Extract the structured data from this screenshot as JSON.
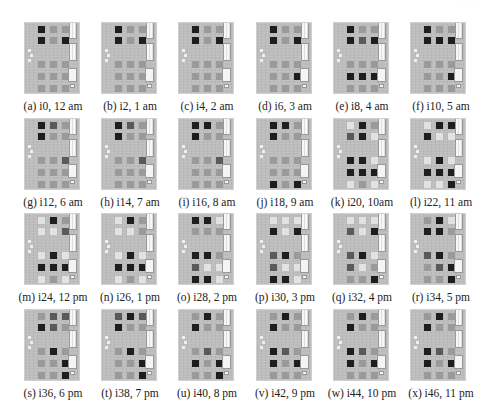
{
  "header_fragment": "· ·        ·",
  "figure": {
    "columns": 6,
    "rows": 4,
    "panels": [
      {
        "tag": "(a)",
        "iter": "i0",
        "time": "12 am",
        "caption": "(a) i0, 12 am",
        "dark": [
          [
            0,
            0
          ],
          [
            1,
            0
          ],
          [
            1,
            2
          ]
        ],
        "light": [],
        "mid": []
      },
      {
        "tag": "(b)",
        "iter": "i2",
        "time": "1 am",
        "caption": "(b) i2, 1 am",
        "dark": [
          [
            0,
            0
          ],
          [
            1,
            0
          ],
          [
            1,
            2
          ]
        ],
        "light": [],
        "mid": []
      },
      {
        "tag": "(c)",
        "iter": "i4",
        "time": "2 am",
        "caption": "(c) i4, 2 am",
        "dark": [
          [
            0,
            0
          ],
          [
            1,
            0
          ],
          [
            1,
            2
          ]
        ],
        "light": [],
        "mid": []
      },
      {
        "tag": "(d)",
        "iter": "i6",
        "time": "3 am",
        "caption": "(d) i6, 3 am",
        "dark": [
          [
            0,
            0
          ],
          [
            1,
            0
          ],
          [
            1,
            2
          ],
          [
            3,
            2
          ]
        ],
        "light": [],
        "mid": []
      },
      {
        "tag": "(e)",
        "iter": "i8",
        "time": "4 am",
        "caption": "(e) i8, 4 am",
        "dark": [
          [
            0,
            0
          ],
          [
            1,
            0
          ],
          [
            1,
            2
          ],
          [
            3,
            0
          ],
          [
            3,
            1
          ],
          [
            3,
            2
          ]
        ],
        "light": [],
        "mid": [
          [
            1,
            1
          ]
        ]
      },
      {
        "tag": "(f)",
        "iter": "i10",
        "time": "5 am",
        "caption": "(f) i10, 5 am",
        "dark": [
          [
            0,
            0
          ],
          [
            1,
            0
          ],
          [
            1,
            1
          ],
          [
            1,
            2
          ],
          [
            3,
            2
          ]
        ],
        "light": [],
        "mid": []
      },
      {
        "tag": "(g)",
        "iter": "i12",
        "time": "6 am",
        "caption": "(g) i12, 6 am",
        "dark": [
          [
            0,
            0
          ],
          [
            1,
            0
          ]
        ],
        "light": [],
        "mid": [
          [
            0,
            1
          ],
          [
            2,
            2
          ]
        ]
      },
      {
        "tag": "(h)",
        "iter": "i14",
        "time": "7 am",
        "caption": "(h) i14, 7 am",
        "dark": [
          [
            0,
            0
          ],
          [
            1,
            0
          ]
        ],
        "light": [],
        "mid": [
          [
            0,
            1
          ],
          [
            2,
            2
          ]
        ]
      },
      {
        "tag": "(i)",
        "iter": "i16",
        "time": "8 am",
        "caption": "(i) i16, 8 am",
        "dark": [
          [
            0,
            0
          ],
          [
            0,
            1
          ],
          [
            1,
            0
          ]
        ],
        "light": [],
        "mid": [
          [
            2,
            2
          ]
        ]
      },
      {
        "tag": "(j)",
        "iter": "i18",
        "time": "9 am",
        "caption": "(j) i18, 9 am",
        "dark": [
          [
            0,
            0
          ],
          [
            0,
            1
          ],
          [
            1,
            0
          ],
          [
            4,
            0
          ],
          [
            4,
            2
          ]
        ],
        "light": [],
        "mid": []
      },
      {
        "tag": "(k)",
        "iter": "i20",
        "time": "10am",
        "caption": "(k) i20, 10am",
        "dark": [
          [
            0,
            1
          ],
          [
            1,
            1
          ],
          [
            2,
            0
          ],
          [
            2,
            1
          ],
          [
            3,
            0
          ],
          [
            3,
            1
          ],
          [
            3,
            2
          ]
        ],
        "light": [
          [
            0,
            0
          ],
          [
            1,
            2
          ],
          [
            2,
            2
          ],
          [
            4,
            0
          ],
          [
            4,
            2
          ]
        ],
        "mid": [
          [
            1,
            0
          ]
        ]
      },
      {
        "tag": "(l)",
        "iter": "i22",
        "time": "11 am",
        "caption": "(l) i22, 11 am",
        "dark": [
          [
            0,
            1
          ],
          [
            0,
            2
          ],
          [
            1,
            0
          ],
          [
            2,
            1
          ],
          [
            3,
            0
          ],
          [
            3,
            1
          ],
          [
            3,
            2
          ],
          [
            4,
            2
          ]
        ],
        "light": [
          [
            0,
            0
          ],
          [
            1,
            1
          ],
          [
            1,
            2
          ],
          [
            2,
            0
          ],
          [
            2,
            2
          ],
          [
            4,
            0
          ],
          [
            4,
            1
          ]
        ],
        "mid": []
      },
      {
        "tag": "(m)",
        "iter": "i24",
        "time": "12 pm",
        "caption": "(m) i24, 12 pm",
        "dark": [
          [
            0,
            1
          ],
          [
            2,
            1
          ],
          [
            3,
            0
          ],
          [
            3,
            1
          ],
          [
            3,
            2
          ]
        ],
        "light": [
          [
            0,
            0
          ],
          [
            1,
            0
          ],
          [
            1,
            1
          ],
          [
            2,
            0
          ],
          [
            2,
            2
          ],
          [
            4,
            0
          ],
          [
            4,
            2
          ]
        ],
        "mid": [
          [
            1,
            2
          ]
        ]
      },
      {
        "tag": "(n)",
        "iter": "i26",
        "time": "1 pm",
        "caption": "(n) i26, 1 pm",
        "dark": [
          [
            0,
            1
          ],
          [
            2,
            1
          ],
          [
            3,
            0
          ],
          [
            3,
            1
          ],
          [
            3,
            2
          ]
        ],
        "light": [
          [
            0,
            0
          ],
          [
            1,
            0
          ],
          [
            1,
            1
          ],
          [
            2,
            0
          ],
          [
            2,
            2
          ],
          [
            4,
            0
          ],
          [
            4,
            2
          ]
        ],
        "mid": []
      },
      {
        "tag": "(o)",
        "iter": "i28",
        "time": "2 pm",
        "caption": "(o) i28, 2 pm",
        "dark": [
          [
            0,
            0
          ],
          [
            0,
            1
          ],
          [
            2,
            0
          ],
          [
            2,
            1
          ],
          [
            4,
            0
          ],
          [
            4,
            1
          ]
        ],
        "light": [
          [
            0,
            2
          ],
          [
            3,
            1
          ],
          [
            3,
            2
          ],
          [
            4,
            2
          ]
        ],
        "mid": [
          [
            3,
            0
          ]
        ]
      },
      {
        "tag": "(p)",
        "iter": "i30",
        "time": "3 pm",
        "caption": "(p) i30, 3 pm",
        "dark": [
          [
            1,
            0
          ],
          [
            1,
            2
          ],
          [
            2,
            1
          ],
          [
            4,
            0
          ],
          [
            4,
            1
          ]
        ],
        "light": [
          [
            0,
            0
          ],
          [
            0,
            1
          ],
          [
            0,
            2
          ],
          [
            1,
            1
          ],
          [
            3,
            1
          ],
          [
            3,
            2
          ],
          [
            4,
            2
          ]
        ],
        "mid": [
          [
            2,
            0
          ],
          [
            3,
            0
          ]
        ]
      },
      {
        "tag": "(q)",
        "iter": "i32",
        "time": "4 pm",
        "caption": "(q) i32, 4 pm",
        "dark": [
          [
            1,
            2
          ],
          [
            2,
            1
          ],
          [
            4,
            2
          ]
        ],
        "light": [
          [
            0,
            0
          ],
          [
            0,
            1
          ],
          [
            0,
            2
          ],
          [
            1,
            1
          ],
          [
            2,
            2
          ],
          [
            3,
            1
          ]
        ],
        "mid": [
          [
            1,
            0
          ],
          [
            2,
            0
          ],
          [
            3,
            0
          ]
        ]
      },
      {
        "tag": "(r)",
        "iter": "i34",
        "time": "5 pm",
        "caption": "(r) i34, 5 pm",
        "dark": [
          [
            0,
            1
          ],
          [
            1,
            0
          ],
          [
            1,
            1
          ],
          [
            2,
            1
          ],
          [
            3,
            2
          ],
          [
            4,
            2
          ]
        ],
        "light": [
          [
            0,
            2
          ]
        ],
        "mid": [
          [
            2,
            0
          ],
          [
            3,
            1
          ]
        ]
      },
      {
        "tag": "(s)",
        "iter": "i36",
        "time": "6 pm",
        "caption": "(s) i36, 6 pm",
        "dark": [
          [
            1,
            0
          ],
          [
            2,
            1
          ],
          [
            3,
            2
          ],
          [
            4,
            2
          ]
        ],
        "light": [],
        "mid": [
          [
            0,
            1
          ],
          [
            0,
            2
          ],
          [
            1,
            1
          ]
        ]
      },
      {
        "tag": "(t)",
        "iter": "i38",
        "time": "7 pm",
        "caption": "(t) i38, 7 pm",
        "dark": [
          [
            0,
            1
          ],
          [
            1,
            0
          ],
          [
            2,
            1
          ],
          [
            3,
            2
          ],
          [
            4,
            2
          ]
        ],
        "light": [],
        "mid": [
          [
            0,
            0
          ],
          [
            0,
            2
          ]
        ]
      },
      {
        "tag": "(u)",
        "iter": "i40",
        "time": "8 pm",
        "caption": "(u) i40, 8 pm",
        "dark": [
          [
            0,
            1
          ],
          [
            1,
            0
          ],
          [
            3,
            0
          ],
          [
            3,
            2
          ],
          [
            4,
            2
          ]
        ],
        "light": [],
        "mid": [
          [
            2,
            1
          ]
        ]
      },
      {
        "tag": "(v)",
        "iter": "i42",
        "time": "9 pm",
        "caption": "(v) i42, 9 pm",
        "dark": [
          [
            0,
            1
          ],
          [
            1,
            0
          ],
          [
            2,
            0
          ],
          [
            3,
            0
          ],
          [
            3,
            2
          ]
        ],
        "light": [],
        "mid": [
          [
            2,
            1
          ]
        ]
      },
      {
        "tag": "(w)",
        "iter": "i44",
        "time": "10 pm",
        "caption": "(w) i44, 10 pm",
        "dark": [
          [
            0,
            1
          ],
          [
            1,
            0
          ],
          [
            2,
            0
          ],
          [
            3,
            0
          ],
          [
            3,
            2
          ]
        ],
        "light": [],
        "mid": [
          [
            2,
            1
          ]
        ]
      },
      {
        "tag": "(x)",
        "iter": "i46",
        "time": "11 pm",
        "caption": "(x) i46, 11 pm",
        "dark": [
          [
            0,
            1
          ],
          [
            1,
            0
          ],
          [
            2,
            0
          ],
          [
            3,
            0
          ],
          [
            3,
            2
          ]
        ],
        "light": [],
        "mid": [
          [
            2,
            1
          ]
        ]
      }
    ]
  },
  "colors": {
    "board": "#bdbdbd",
    "dark_square": "#1e1e1e",
    "mid_square": "#5a5a5a",
    "light_square": "#e2e2e2",
    "idle_square": "#9a9a9a"
  }
}
